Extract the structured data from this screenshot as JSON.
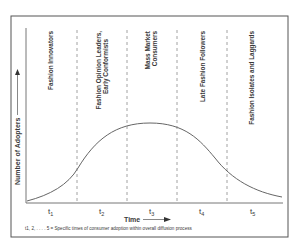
{
  "figure": {
    "y_axis_label": "Number of Adopters",
    "x_axis_label": "Time",
    "footnote": "t1, 2, . . . . 5 = Specific times of consumer adoption within overall diffusion process",
    "segments": [
      {
        "id": "t1",
        "tick_label": "t1",
        "tick_main": "t",
        "tick_sub": "1",
        "label_lines": [
          "Fashion Innovators"
        ]
      },
      {
        "id": "t2",
        "tick_label": "t2",
        "tick_main": "t",
        "tick_sub": "2",
        "label_lines": [
          "Fashion Opinion Leaders,",
          "Early Conformists"
        ]
      },
      {
        "id": "t3",
        "tick_label": "t3",
        "tick_main": "t",
        "tick_sub": "3",
        "label_lines": [
          "Mass Market",
          "Consumers"
        ]
      },
      {
        "id": "t4",
        "tick_label": "t4",
        "tick_main": "t",
        "tick_sub": "4",
        "label_lines": [
          "Late Fashion Followers"
        ]
      },
      {
        "id": "t5",
        "tick_label": "t5",
        "tick_main": "t",
        "tick_sub": "5",
        "label_lines": [
          "Fashion Isolates and Laggards"
        ]
      }
    ],
    "curve": {
      "type": "bell-shaped diffusion curve",
      "description": "Number of adopters rises from near zero at t1, peaks at t3, and declines toward t5"
    },
    "colors": {
      "frame": "#555555",
      "axis": "#777777",
      "curve": "#666666",
      "dashes": "#8a8a8a",
      "text": "#3a3a3a"
    }
  }
}
